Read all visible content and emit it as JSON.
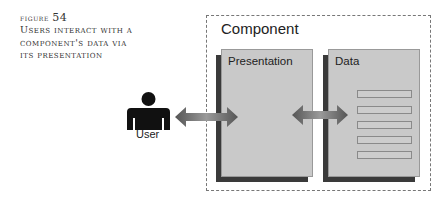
{
  "caption": {
    "figure_label": "figure",
    "figure_number": "54",
    "title_lines": [
      "Users interact with a",
      "component's data via",
      "its presentation"
    ]
  },
  "diagram": {
    "container_label": "Component",
    "presentation_label": "Presentation",
    "data_label": "Data",
    "user_label": "User",
    "data_rows": 5,
    "colors": {
      "box_face": "#c9c9c9",
      "box_shadow": "#3a3a3a",
      "dashed_border": "#777777",
      "arrow": "#666666",
      "user_icon": "#111111"
    }
  }
}
